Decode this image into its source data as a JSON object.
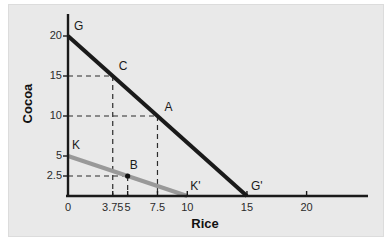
{
  "chart_data": {
    "type": "line",
    "title": "",
    "xlabel": "Rice",
    "ylabel": "Cocoa",
    "xlim": [
      0,
      23
    ],
    "ylim": [
      0,
      22
    ],
    "grid": false,
    "legend": "none",
    "xticks": [
      {
        "value": 0,
        "label": "0"
      },
      {
        "value": 3.75,
        "label": "3.75"
      },
      {
        "value": 5,
        "label": "5"
      },
      {
        "value": 7.5,
        "label": "7.5"
      },
      {
        "value": 10,
        "label": "10"
      },
      {
        "value": 15,
        "label": "15"
      },
      {
        "value": 20,
        "label": "20"
      }
    ],
    "yticks": [
      {
        "value": 2.5,
        "label": "2.5"
      },
      {
        "value": 5,
        "label": "5"
      },
      {
        "value": 10,
        "label": "10"
      },
      {
        "value": 15,
        "label": "15"
      },
      {
        "value": 20,
        "label": "20"
      }
    ],
    "series": [
      {
        "name": "GG'",
        "color": "#1a1a1a",
        "width": 4,
        "points": [
          {
            "x": 0,
            "y": 20
          },
          {
            "x": 15,
            "y": 0
          }
        ]
      },
      {
        "name": "KK'",
        "color": "#999999",
        "width": 4,
        "points": [
          {
            "x": 0,
            "y": 5
          },
          {
            "x": 10,
            "y": 0
          }
        ]
      }
    ],
    "annotations": [
      {
        "label": "G",
        "x": 0,
        "y": 20,
        "dot": false
      },
      {
        "label": "C",
        "x": 3.75,
        "y": 15,
        "dot": false
      },
      {
        "label": "A",
        "x": 7.5,
        "y": 10,
        "dot": false
      },
      {
        "label": "K",
        "x": 0,
        "y": 5,
        "dot": false
      },
      {
        "label": "B",
        "x": 5,
        "y": 2.5,
        "dot": true
      },
      {
        "label": "K'",
        "x": 10,
        "y": 0,
        "dot": false
      },
      {
        "label": "G'",
        "x": 15,
        "y": 0,
        "dot": false
      }
    ],
    "guides": [
      {
        "y": 15,
        "x": 3.75
      },
      {
        "y": 10,
        "x": 7.5
      },
      {
        "y": 2.5,
        "x": 5
      }
    ],
    "axis_color": "#1a1a1a",
    "guide_color": "#2b2b2b",
    "panel_color": "#e9e9e9"
  }
}
